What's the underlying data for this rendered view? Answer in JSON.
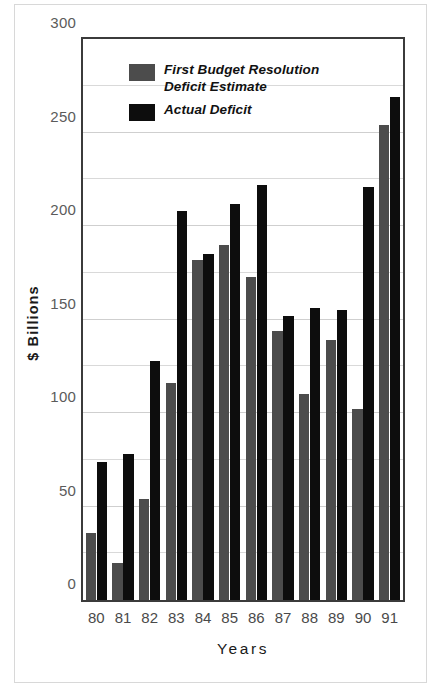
{
  "chart_data": {
    "type": "bar",
    "title": "",
    "xlabel": "Years",
    "ylabel": "$ Billions",
    "ylim": [
      0,
      300
    ],
    "ytick_values": [
      0,
      50,
      100,
      150,
      200,
      250,
      300
    ],
    "ytick_labels": [
      "0",
      "50",
      "100",
      "150",
      "200",
      "250",
      "300"
    ],
    "gridline_values": [
      25,
      50,
      75,
      100,
      125,
      150,
      175,
      200,
      225,
      250,
      275
    ],
    "grid": true,
    "legend_position": "upper-left-inside",
    "categories": [
      "80",
      "81",
      "82",
      "83",
      "84",
      "85",
      "86",
      "87",
      "88",
      "89",
      "90",
      "91"
    ],
    "series": [
      {
        "name": "First Budget Resolution\nDeficit Estimate",
        "color": "#4c4c4c",
        "values": [
          36,
          20,
          54,
          116,
          182,
          190,
          173,
          144,
          110,
          139,
          102,
          254
        ]
      },
      {
        "name": "Actual Deficit",
        "color": "#0d0d0d",
        "values": [
          74,
          78,
          128,
          208,
          185,
          212,
          222,
          152,
          156,
          155,
          221,
          269
        ]
      }
    ]
  },
  "legend": {
    "items": [
      {
        "label_line1": "First Budget Resolution",
        "label_line2": "Deficit Estimate",
        "color": "#4c4c4c"
      },
      {
        "label_line1": "Actual Deficit",
        "label_line2": "",
        "color": "#0d0d0d"
      }
    ]
  },
  "colors": {
    "estimate_bar": "#4c4c4c",
    "actual_bar": "#0d0d0d",
    "frame": "#3b3b3b",
    "gridline": "#d9d9d9",
    "tick_text": "#5b5b5b",
    "background": "#ffffff"
  }
}
